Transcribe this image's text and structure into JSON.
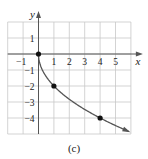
{
  "chart_data": {
    "type": "line",
    "title": "",
    "caption": "(c)",
    "xlabel": "x",
    "ylabel": "y",
    "xlim": [
      -2,
      6
    ],
    "ylim": [
      -5,
      2
    ],
    "grid": true,
    "x_ticks": [
      -1,
      1,
      2,
      3,
      4,
      5
    ],
    "y_ticks": [
      1,
      -1,
      -2,
      -3,
      -4
    ],
    "x_tick_labels": [
      "−1",
      "1",
      "2",
      "3",
      "4",
      "5"
    ],
    "y_tick_labels": [
      "1",
      "−1",
      "−2",
      "−3",
      "−4"
    ],
    "series": [
      {
        "name": "curve",
        "function": "y = -2*sqrt(x)",
        "x": [
          0,
          0.25,
          1,
          2,
          3,
          4,
          5,
          6
        ],
        "y": [
          0,
          -1,
          -2,
          -2.83,
          -3.46,
          -4,
          -4.47,
          -4.9
        ],
        "end_arrow": true
      }
    ],
    "points": [
      {
        "x": 0,
        "y": 0
      },
      {
        "x": 1,
        "y": -2
      },
      {
        "x": 4,
        "y": -4
      }
    ]
  },
  "colors": {
    "grid": "#c8c8c8",
    "axis": "#555555",
    "curve": "#555555",
    "point": "#111111",
    "text": "#222222"
  }
}
